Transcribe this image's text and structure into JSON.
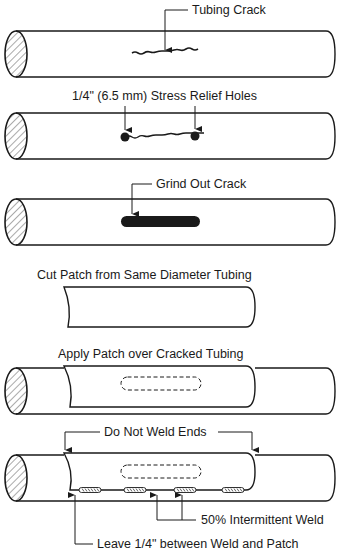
{
  "diagram": {
    "steps": [
      {
        "id": 1,
        "label": "Tubing Crack"
      },
      {
        "id": 2,
        "label": "1/4\" (6.5 mm) Stress Relief Holes"
      },
      {
        "id": 3,
        "label": "Grind Out Crack"
      },
      {
        "id": 4,
        "label": "Cut Patch from Same Diameter Tubing"
      },
      {
        "id": 5,
        "label": "Apply Patch over Cracked Tubing"
      },
      {
        "id": 6,
        "labels": {
          "ends": "Do Not Weld Ends",
          "weld": "50% Intermittent Weld",
          "gap": "Leave 1/4\" between Weld and Patch"
        }
      }
    ],
    "colors": {
      "line": "#1a1a1a",
      "background": "#ffffff",
      "hatch": "#555555"
    }
  }
}
